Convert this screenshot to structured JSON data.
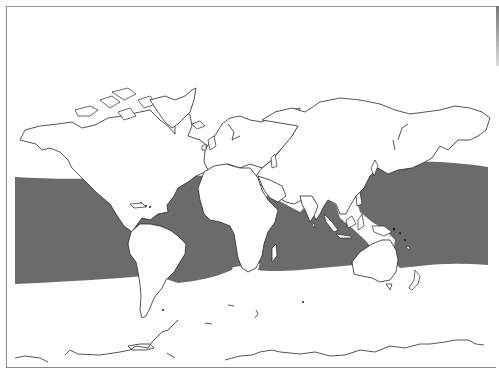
{
  "map": {
    "type": "world-map",
    "projection": "equirectangular-like, Pacific-centered split at Americas (left) to Pacific (right)",
    "description": "World outline map with a shaded band covering tropical/subtropical oceans",
    "colors": {
      "background": "#ffffff",
      "land_fill": "#ffffff",
      "coastline": "#2a2a2a",
      "shaded_range": "#6b6b6b",
      "frame": "#8a8a8a"
    },
    "shaded_region": {
      "label": "",
      "approx_latitude_extent": "about 35°N to 35°S",
      "regions": [
        "Eastern Pacific",
        "Caribbean Sea / Gulf of Mexico",
        "Atlantic Ocean",
        "Indian Ocean",
        "Western Pacific / Indo-Pacific"
      ]
    },
    "legend": null,
    "title": ""
  }
}
